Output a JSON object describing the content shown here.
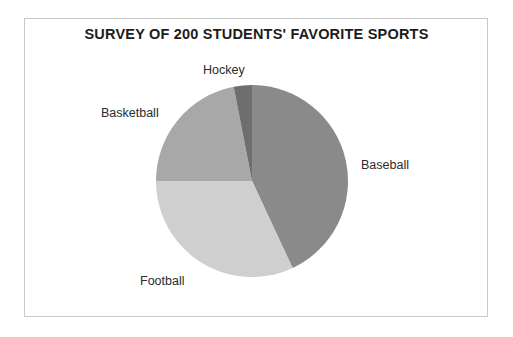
{
  "figure": {
    "title": "SURVEY OF 200 STUDENTS' FAVORITE SPORTS",
    "border_color": "#c9c9c9",
    "background": "#ffffff"
  },
  "chart_data": {
    "type": "pie",
    "title": "SURVEY OF 200 STUDENTS' FAVORITE SPORTS",
    "xlabel": "",
    "ylabel": "",
    "total": 200,
    "units": "students",
    "start_angle_deg": 0,
    "direction": "clockwise",
    "grid": false,
    "legend": "none",
    "labels_position": "outside",
    "categories": [
      "Baseball",
      "Football",
      "Basketball",
      "Hockey"
    ],
    "values": [
      86,
      64,
      44,
      6
    ],
    "percentages": [
      43,
      32,
      22,
      3
    ],
    "angles_deg": [
      155,
      115,
      79,
      11
    ],
    "colors": [
      "#8a8a8a",
      "#cfcfcf",
      "#a8a8a8",
      "#6e6e6e"
    ],
    "slices": [
      {
        "label": "Baseball",
        "value": 86,
        "percent": 43,
        "angle_deg": 155,
        "start_deg": 0,
        "end_deg": 155,
        "color": "#8a8a8a"
      },
      {
        "label": "Football",
        "value": 64,
        "percent": 32,
        "angle_deg": 115,
        "start_deg": 155,
        "end_deg": 270,
        "color": "#cfcfcf"
      },
      {
        "label": "Basketball",
        "value": 44,
        "percent": 22,
        "angle_deg": 79,
        "start_deg": 270,
        "end_deg": 349,
        "color": "#a8a8a8"
      },
      {
        "label": "Hockey",
        "value": 6,
        "percent": 3,
        "angle_deg": 11,
        "start_deg": 349,
        "end_deg": 360,
        "color": "#6e6e6e"
      }
    ]
  },
  "labels": {
    "hockey": "Hockey",
    "basketball": "Basketball",
    "baseball": "Baseball",
    "football": "Football"
  }
}
